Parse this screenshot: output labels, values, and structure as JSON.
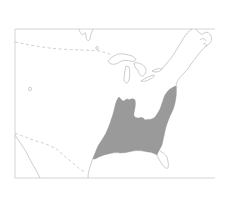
{
  "map": {
    "type": "species-range-map",
    "region": "Eastern North America",
    "colors": {
      "background": "#ffffff",
      "frame": "#c9c9c9",
      "coastline": "#b8b8b8",
      "international_border": "#c4c4c4",
      "range_fill": "#9a9a9a"
    },
    "layers": [
      {
        "id": "frame",
        "label": "Map frame"
      },
      {
        "id": "canada-us-border",
        "label": "Canada–US border (dashed)"
      },
      {
        "id": "mexico-us-border",
        "label": "Mexico–US border (dashed)"
      },
      {
        "id": "great-lakes",
        "label": "Great Lakes"
      },
      {
        "id": "atlantic-coast",
        "label": "Atlantic coastline"
      },
      {
        "id": "gulf-coast",
        "label": "Gulf coastline"
      },
      {
        "id": "florida",
        "label": "Florida peninsula"
      },
      {
        "id": "range",
        "label": "Shaded distribution range (southeastern US)"
      }
    ]
  }
}
